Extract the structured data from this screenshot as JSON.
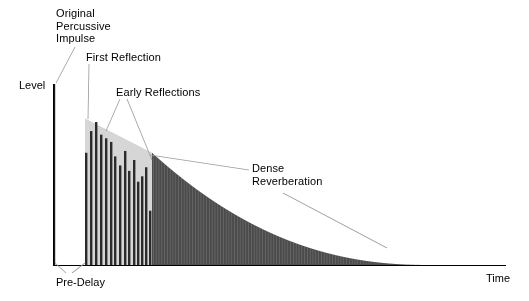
{
  "figure": {
    "background": "#ffffff"
  },
  "axes": {
    "y_label": "Level",
    "x_label": "Time",
    "origin_x": 53,
    "baseline_y": 265,
    "y_top": 84,
    "x_right": 506,
    "axis_color": "#000000",
    "grid": false
  },
  "annotations": [
    {
      "name": "original-percussive-impulse",
      "text": "Original\nPercussive\nImpulse",
      "x": 56,
      "y": 7,
      "leaders": [
        [
          [
            75,
            47
          ],
          [
            56,
            83
          ]
        ]
      ]
    },
    {
      "name": "first-reflection",
      "text": "First Reflection",
      "x": 86,
      "y": 51,
      "leaders": [
        [
          [
            89,
            64
          ],
          [
            88,
            119
          ]
        ]
      ]
    },
    {
      "name": "early-reflections",
      "text": "Early Reflections",
      "x": 116,
      "y": 86,
      "leaders": [
        [
          [
            120,
            99
          ],
          [
            106,
            131
          ]
        ],
        [
          [
            127,
            99
          ],
          [
            152,
            160
          ]
        ]
      ]
    },
    {
      "name": "dense-reverberation",
      "text": "Dense\nReverberation",
      "x": 252,
      "y": 162,
      "leaders": [
        [
          [
            249,
            170
          ],
          [
            150,
            155
          ]
        ],
        [
          [
            283,
            193
          ],
          [
            387,
            248
          ]
        ]
      ]
    },
    {
      "name": "pre-delay",
      "text": "Pre-Delay",
      "x": 56,
      "y": 276,
      "leaders": [
        [
          [
            66,
            273
          ],
          [
            55,
            263
          ]
        ],
        [
          [
            72,
            273
          ],
          [
            85,
            263
          ]
        ]
      ]
    }
  ],
  "colors": {
    "impulse": "#1a1a1a",
    "early_bar": "#2b2b2b",
    "envelope_light": "#d6d6d6",
    "dense_fill": "#4b4b4b",
    "dense_striation": "#6e6e6e",
    "axis": "#000000",
    "leader": "#9a9a9a",
    "text": "#000000"
  },
  "chart_data": {
    "type": "bar",
    "xlabel": "Time",
    "ylabel": "Level",
    "xlim": [
      0,
      506
    ],
    "ylim": [
      0,
      1
    ],
    "grid": false,
    "legend": null,
    "regions": [
      {
        "name": "direct-impulse",
        "x_start": 53,
        "x_end": 55,
        "level": 1.0
      },
      {
        "name": "pre-delay",
        "x_start": 55,
        "x_end": 85,
        "level": 0.0
      },
      {
        "name": "early-reflections",
        "x_start": 85,
        "x_end": 152,
        "level_start": 0.81,
        "level_end": 0.5
      },
      {
        "name": "dense-reverberation",
        "x_start": 152,
        "x_end": 430,
        "level_start": 0.62,
        "level_end": 0.0
      }
    ],
    "impulse": {
      "x": 53,
      "level": 1.0
    },
    "early_envelope": {
      "x_start": 85,
      "x_end": 152,
      "level_start": 0.81,
      "level_end": 0.46,
      "comment": "light gray triangular envelope behind the discrete early reflections"
    },
    "early_reflections": {
      "x_positions": [
        85,
        90,
        95,
        100,
        105,
        110,
        114,
        119,
        124,
        128,
        133,
        137,
        141,
        145,
        149
      ],
      "levels": [
        0.62,
        0.74,
        0.79,
        0.72,
        0.7,
        0.68,
        0.6,
        0.55,
        0.63,
        0.52,
        0.58,
        0.46,
        0.49,
        0.54,
        0.3
      ],
      "bar_width": 2.4
    },
    "dense_reverberation": {
      "x_start": 152,
      "x_end": 430,
      "envelope_type": "exponential-decay",
      "level_start": 0.62,
      "decay_exponent": 2.25,
      "bar_count": 100,
      "bar_pitch": 2.8,
      "comment": "tightly packed vertical striations under a smooth exponentially decaying envelope"
    }
  }
}
